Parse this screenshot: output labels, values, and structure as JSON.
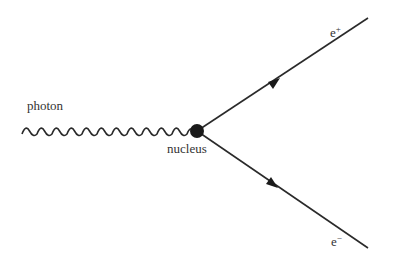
{
  "diagram": {
    "type": "feynman-pair-production",
    "labels": {
      "photon": "photon",
      "nucleus": "nucleus",
      "positron": "e",
      "positron_sup": "+",
      "electron": "e",
      "electron_sup": "−"
    },
    "colors": {
      "line": "#2a2a2a",
      "nucleus": "#1a1a1a",
      "text": "#333333"
    }
  }
}
